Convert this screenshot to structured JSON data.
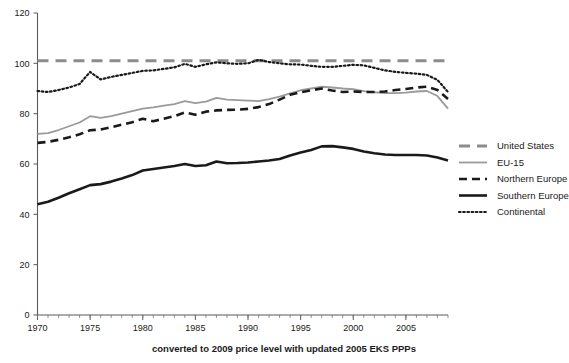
{
  "chart_data": {
    "type": "line",
    "title": "",
    "subtitle": "",
    "caption": "converted to 2009 price level with updated 2005 EKS PPPs",
    "xlabel": "",
    "ylabel": "",
    "xlim": [
      1970,
      2009
    ],
    "ylim": [
      0,
      120
    ],
    "grid": false,
    "legend_position": "right",
    "y_ticks": [
      0,
      20,
      40,
      60,
      80,
      100,
      120
    ],
    "x_ticks": [
      1970,
      1975,
      1980,
      1985,
      1990,
      1995,
      2000,
      2005
    ],
    "x_tick_labels": [
      "1970",
      "1975",
      "1980",
      "1985",
      "1990",
      "1995",
      "2000",
      "2005"
    ],
    "y_tick_labels": [
      "0",
      "20",
      "40",
      "60",
      "80",
      "100",
      "120"
    ],
    "x": [
      1970,
      1971,
      1972,
      1973,
      1974,
      1975,
      1976,
      1977,
      1978,
      1979,
      1980,
      1981,
      1982,
      1983,
      1984,
      1985,
      1986,
      1987,
      1988,
      1989,
      1990,
      1991,
      1992,
      1993,
      1994,
      1995,
      1996,
      1997,
      1998,
      1999,
      2000,
      2001,
      2002,
      2003,
      2004,
      2005,
      2006,
      2007,
      2008,
      2009
    ],
    "series": [
      {
        "name": "United States",
        "style": "dashed-wide",
        "color": "#8c8c8c",
        "width": 3.0,
        "values": [
          101,
          101,
          101,
          101,
          101,
          101,
          101,
          101,
          101,
          101,
          101,
          101,
          101,
          101,
          101,
          101,
          101,
          101,
          101,
          101,
          101,
          101,
          101,
          101,
          101,
          101,
          101,
          101,
          101,
          101,
          101,
          101,
          101,
          101,
          101,
          101,
          101,
          101,
          101,
          101
        ]
      },
      {
        "name": "EU-15",
        "style": "solid",
        "color": "#9a9a9a",
        "width": 1.8,
        "values": [
          72.0,
          72.3,
          73.5,
          75.0,
          76.5,
          79.0,
          78.3,
          79.0,
          80.0,
          81.0,
          82.0,
          82.5,
          83.2,
          83.8,
          85.0,
          84.2,
          84.8,
          86.3,
          85.6,
          85.4,
          85.2,
          85.0,
          85.8,
          86.8,
          88.1,
          89.3,
          90.0,
          90.7,
          90.4,
          90.0,
          89.7,
          89.0,
          88.5,
          88.2,
          88.2,
          88.4,
          88.8,
          89.0,
          87.0,
          82.0
        ]
      },
      {
        "name": "Northern Europe",
        "style": "dashed",
        "color": "#1a1a1a",
        "width": 2.6,
        "values": [
          68.4,
          68.8,
          69.6,
          70.6,
          71.8,
          73.4,
          73.7,
          74.6,
          75.6,
          76.6,
          78.0,
          77.0,
          78.0,
          79.0,
          80.5,
          79.6,
          80.8,
          81.3,
          81.5,
          81.6,
          81.9,
          82.6,
          83.8,
          85.6,
          87.5,
          88.5,
          89.3,
          90.0,
          89.2,
          88.6,
          88.8,
          88.6,
          88.6,
          88.8,
          89.4,
          89.8,
          90.4,
          90.7,
          89.4,
          85.8
        ]
      },
      {
        "name": "Southern Europe",
        "style": "solid-thick",
        "color": "#1a1a1a",
        "width": 2.6,
        "values": [
          44.0,
          45.0,
          46.6,
          48.4,
          50.0,
          51.6,
          52.0,
          53.0,
          54.2,
          55.6,
          57.4,
          58.0,
          58.6,
          59.2,
          60.0,
          59.2,
          59.5,
          61.0,
          60.3,
          60.4,
          60.6,
          61.0,
          61.4,
          62.0,
          63.4,
          64.6,
          65.6,
          67.0,
          67.1,
          66.6,
          66.0,
          65.0,
          64.3,
          63.8,
          63.6,
          63.6,
          63.6,
          63.4,
          62.6,
          61.4
        ]
      },
      {
        "name": "Continental",
        "style": "dotted",
        "color": "#1a1a1a",
        "width": 2.2,
        "values": [
          89.0,
          88.6,
          89.4,
          90.4,
          91.8,
          96.6,
          93.6,
          94.6,
          95.4,
          96.2,
          97.0,
          97.2,
          97.8,
          98.4,
          99.8,
          98.6,
          99.6,
          100.4,
          100.0,
          99.8,
          100.0,
          101.4,
          100.5,
          100.0,
          99.6,
          99.5,
          99.0,
          98.6,
          98.6,
          99.0,
          99.4,
          99.2,
          98.2,
          97.2,
          96.6,
          96.2,
          95.9,
          95.4,
          93.4,
          88.6
        ]
      }
    ],
    "legend_entries": [
      {
        "label": "United States",
        "style": "dashed-wide",
        "color": "#8c8c8c"
      },
      {
        "label": "EU-15",
        "style": "solid",
        "color": "#9a9a9a"
      },
      {
        "label": "Northern Europe",
        "style": "dashed",
        "color": "#1a1a1a"
      },
      {
        "label": "Southern Europe",
        "style": "solid-thick",
        "color": "#1a1a1a"
      },
      {
        "label": "Continental",
        "style": "dotted",
        "color": "#1a1a1a"
      }
    ]
  }
}
